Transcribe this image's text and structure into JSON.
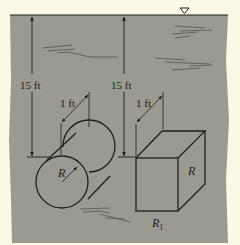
{
  "figure": {
    "type": "fluid-statics-submerged-bodies",
    "free_surface_symbol": "∇",
    "colors": {
      "paper": "#fbf8e6",
      "water": "#9a9a90",
      "line": "#1e1e1e",
      "ripple": "#5d5d55"
    }
  },
  "cylinder": {
    "depth_label": "15 ft",
    "length_label": "1 ft",
    "radius_label": "R"
  },
  "box": {
    "depth_label": "15 ft",
    "length_label": "1 ft",
    "side_label": "R",
    "bottom_label_main": "R",
    "bottom_label_sub": "1"
  }
}
